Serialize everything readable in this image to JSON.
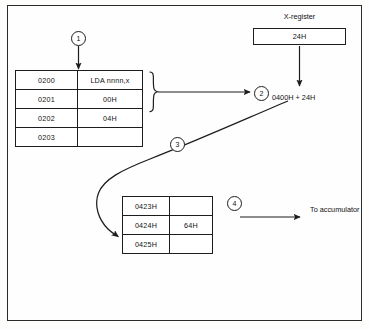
{
  "figure": {
    "border_color": "#2b2b2b",
    "ink_color": "#111111",
    "background": "#fefefe"
  },
  "program_table": {
    "name": "program-memory-table",
    "rows": [
      {
        "address": "0200",
        "value": "LDA nnnn,x"
      },
      {
        "address": "0201",
        "value": "00H"
      },
      {
        "address": "0202",
        "value": "04H"
      },
      {
        "address": "0203",
        "value": ""
      }
    ]
  },
  "data_table": {
    "name": "data-memory-table",
    "rows": [
      {
        "address": "0423H",
        "value": ""
      },
      {
        "address": "0424H",
        "value": "64H"
      },
      {
        "address": "0425H",
        "value": ""
      }
    ]
  },
  "x_register": {
    "label": "X-register",
    "value": "24H"
  },
  "labels": {
    "sum": "0400H + 24H",
    "destination": "To accumulator"
  },
  "callouts": [
    {
      "id": "1",
      "label": "1"
    },
    {
      "id": "2",
      "label": "2"
    },
    {
      "id": "3",
      "label": "3"
    },
    {
      "id": "4",
      "label": "4"
    }
  ]
}
